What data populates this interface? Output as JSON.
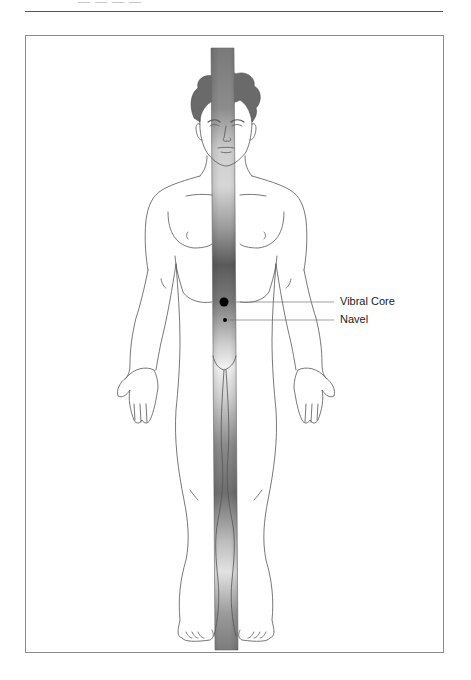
{
  "page": {
    "header_fragment": "— — — —"
  },
  "figure": {
    "column_colors": {
      "dark": "#555555",
      "mid": "#8a8a8a",
      "light": "#eeeeee"
    },
    "markers": [
      {
        "name": "vibral-core",
        "label": "Vibral Core",
        "x": 224,
        "y": 302,
        "radius": 4.5
      },
      {
        "name": "navel",
        "label": "Navel",
        "x": 225,
        "y": 320,
        "radius": 2
      }
    ]
  }
}
